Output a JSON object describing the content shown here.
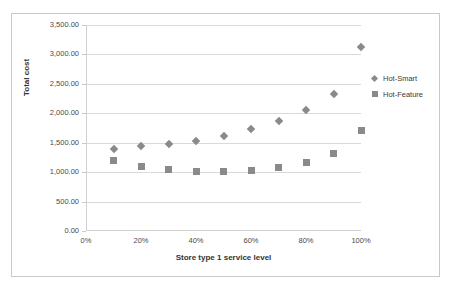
{
  "chart_data": {
    "type": "scatter",
    "title": "",
    "xlabel": "Store type 1 service level",
    "ylabel": "Total cost",
    "xlim": [
      0,
      100
    ],
    "ylim": [
      0,
      3500
    ],
    "grid": true,
    "legend_position": "right",
    "x_tick_labels": [
      "0%",
      "20%",
      "40%",
      "60%",
      "80%",
      "100%"
    ],
    "x_tick_values": [
      0,
      20,
      40,
      60,
      80,
      100
    ],
    "y_tick_labels": [
      "0.00",
      "500.00",
      "1,000.00",
      "1,500.00",
      "2,000.00",
      "2,500.00",
      "3,000.00",
      "3,500.00"
    ],
    "y_tick_values": [
      0,
      500,
      1000,
      1500,
      2000,
      2500,
      3000,
      3500
    ],
    "x": [
      10,
      20,
      30,
      40,
      50,
      60,
      70,
      80,
      90,
      100
    ],
    "series": [
      {
        "name": "Hot-Smart",
        "marker": "diamond",
        "color": "#8a8a8a",
        "values": [
          1390,
          1440,
          1480,
          1525,
          1620,
          1730,
          1865,
          2055,
          2330,
          3130
        ]
      },
      {
        "name": "Hot-Feature",
        "marker": "square",
        "color": "#8a8a8a",
        "values": [
          1190,
          1095,
          1045,
          1015,
          1010,
          1030,
          1080,
          1165,
          1315,
          1700
        ]
      }
    ]
  },
  "legend": {
    "entries": [
      {
        "label": "Hot-Smart",
        "marker": "diamond-marker-icon"
      },
      {
        "label": "Hot-Feature",
        "marker": "square-marker-icon"
      }
    ]
  },
  "colors": {
    "marker": "#8a8a8a",
    "gridline": "#d9d9d9",
    "axis": "#d0d0d0",
    "border": "#c9c9c9",
    "text": "#4a4a4a",
    "title_text": "#333333"
  }
}
